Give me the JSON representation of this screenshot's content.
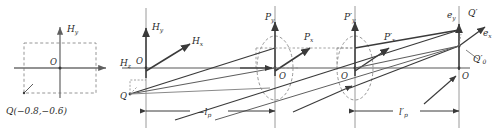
{
  "figure": {
    "type": "optics-ray-diagram",
    "background": "#ffffff",
    "stroke_dark": "#3a3a3a",
    "stroke_mid": "#6e6e6e",
    "stroke_light": "#9a9a9a",
    "dash_color": "#8a8a8a"
  },
  "panels": {
    "object_plane": {
      "name": "object-field-plane",
      "axis_vertical_label": "H",
      "axis_vertical_sub": "y",
      "axis_horizontal_label": "H",
      "axis_horizontal_sub": "x",
      "origin_label": "O",
      "point_label": "Q(−0.8,−0.6)",
      "point_x": -0.8,
      "point_y": -0.6,
      "box_half_width": 1.0,
      "box_half_height": 1.0
    },
    "field_3d": {
      "name": "field-coordinate-frame",
      "axis_y_label": "H",
      "axis_y_sub": "y",
      "axis_x_label": "H",
      "axis_x_sub": "x",
      "axis_z_label": "H",
      "axis_z_sub": "z",
      "origin_label": "O",
      "point_label": "Q"
    },
    "entrance_pupil": {
      "name": "entrance-pupil-plane",
      "axis_y_label": "P",
      "axis_y_sub": "y",
      "axis_x_label": "P",
      "axis_x_sub": "x",
      "origin_label": "O"
    },
    "exit_pupil": {
      "name": "exit-pupil-plane",
      "axis_y_label": "P′",
      "axis_y_sub": "y",
      "axis_x_label": "P′",
      "axis_x_sub": "x",
      "origin_label": "O"
    },
    "image_plane": {
      "name": "image-plane",
      "axis_y_label": "e",
      "axis_y_sub": "y",
      "axis_x_label": "e",
      "axis_x_sub": "x",
      "origin_label": "O",
      "image_point_label": "Q′",
      "ideal_point_label": "Q′",
      "ideal_point_sub": "0"
    }
  },
  "dimensions": [
    {
      "id": "object-distance",
      "label": "−l",
      "sub": "p"
    },
    {
      "id": "image-distance",
      "label": "l′",
      "sub": "p"
    }
  ]
}
